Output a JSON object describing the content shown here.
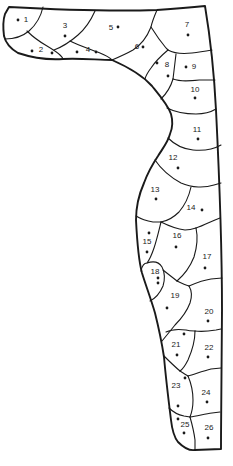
{
  "diagram": {
    "canvas": {
      "width": 233,
      "height": 466,
      "background": "#ffffff",
      "stroke_color": "#1a1a1a",
      "dot_radius": 1.4,
      "label_font_size": 8
    },
    "outline_path": "M 9,7 Q 100,12 157,10 Q 185,8 205,6 C 209,30 214,70 216,110 C 219,170 222,250 222,310 C 222,350 221,400 221,449 L 195,450 C 189,451 183,447 178,442 C 174,437 172,429 171,420 C 169,404 166,380 164,357 C 162,344 159,329 155,313 C 151,299 146,286 142,273 C 139,262 137,240 136,220 C 136,205 140,192 144,183 C 148,172 152,165 158,156 C 163,148 168,142 170,134 C 173,127 173,121 171,114 C 168,105 161,97 152,86 C 143,76 128,67 112,60 C 98,60 80,58 63,59 C 48,60 30,57 18,53 C 11,49 6,44 4,36 C 3,28 3,20 5,14 Z",
    "boundaries": [
      {
        "name": "boundary-1-3",
        "d": "M 43,7 C 41,16 37,24 29,31 C 23,36 15,39 5,39"
      },
      {
        "name": "boundary-2-3",
        "d": "M 27,31 C 33,37 40,42 47,46 C 52,49 57,52 60,55 C 62,57 63,58 63,59"
      },
      {
        "name": "boundary-3-4",
        "d": "M 54,50 C 62,47 70,42 78,35 C 85,29 91,20 95,11"
      },
      {
        "name": "boundary-4-5",
        "d": "M 70,41 C 80,46 90,49 100,53 C 105,55 109,57 112,60"
      },
      {
        "name": "boundary-5-7",
        "d": "M 157,10 C 154,17 152,22 151,27 C 147,37 141,45 133,50 C 126,54 119,57 112,60"
      },
      {
        "name": "boundary-6-7",
        "d": "M 151,27 C 156,35 161,42 166,48 L 168,50"
      },
      {
        "name": "boundary-7-8",
        "d": "M 168,50 C 175,54 183,54 192,53 C 200,52 206,51 212,50"
      },
      {
        "name": "boundary-8-9",
        "d": "M 176,54 C 175,62 174,71 173,79"
      },
      {
        "name": "boundary-6-8",
        "d": "M 168,50 C 162,55 155,62 151,68 C 148,72 146,75 145,79"
      },
      {
        "name": "boundary-8-10",
        "d": "M 173,79 C 171,86 166,94 161,99"
      },
      {
        "name": "boundary-9-10",
        "d": "M 173,79 C 181,82 190,81 200,80 C 206,80 211,80 215,80"
      },
      {
        "name": "boundary-10-11",
        "d": "M 167,108 C 175,112 185,114 196,114 C 204,114 211,112 216,109"
      },
      {
        "name": "boundary-11-12",
        "d": "M 168,138 C 174,144 183,149 193,150 C 203,151 214,149 221,145"
      },
      {
        "name": "boundary-12-13",
        "d": "M 155,160 C 161,169 170,177 181,183 C 192,188 205,188 214,185 L 221,183"
      },
      {
        "name": "boundary-13-14",
        "d": "M 191,187 C 189,196 185,205 179,212 C 173,218 167,221 161,222"
      },
      {
        "name": "boundary-13-15",
        "d": "M 136,216 C 141,219 147,221 153,222 L 161,222"
      },
      {
        "name": "boundary-14-16",
        "d": "M 161,222 C 169,226 177,229 185,230 C 189,230 193,229 196,228"
      },
      {
        "name": "boundary-14-17",
        "d": "M 196,228 C 203,226 210,222 215,220 L 220,218"
      },
      {
        "name": "boundary-16-17",
        "d": "M 196,228 C 198,237 197,247 194,257 C 190,267 184,275 177,281"
      },
      {
        "name": "boundary-15-16",
        "d": "M 161,222 C 159,230 157,239 154,248 C 152,254 150,259 147,263"
      },
      {
        "name": "boundary-18-arc",
        "d": "M 141,271 C 142,266 144,263 147,263 C 153,261 159,262 162,267 C 165,272 165,280 163,286 C 160,293 156,298 150,301"
      },
      {
        "name": "boundary-16-19",
        "d": "M 163,270 C 168,274 172,277 177,281"
      },
      {
        "name": "boundary-17-19",
        "d": "M 177,281 C 181,283 185,285 189,286"
      },
      {
        "name": "boundary-17-20",
        "d": "M 189,286 C 196,283 204,280 211,279 L 222,278"
      },
      {
        "name": "boundary-19-20",
        "d": "M 189,286 C 192,291 192,297 190,303 C 187,311 181,319 175,325 C 171,330 167,335 162,341"
      },
      {
        "name": "boundary-20-21",
        "d": "M 166,332 C 172,329 179,329 186,330 C 189,331 192,331 195,331"
      },
      {
        "name": "boundary-20-22",
        "d": "M 195,331 C 202,332 210,331 216,330 L 221,329"
      },
      {
        "name": "boundary-21-22",
        "d": "M 195,331 C 195,341 192,351 188,360 C 185,366 183,369 180,371"
      },
      {
        "name": "boundary-21-23",
        "d": "M 164,356 C 169,361 174,366 180,371"
      },
      {
        "name": "boundary-22-23",
        "d": "M 180,371 C 183,373 186,375 188,376"
      },
      {
        "name": "boundary-22-24",
        "d": "M 188,376 C 195,374 203,371 211,369 L 221,368"
      },
      {
        "name": "boundary-23-24",
        "d": "M 188,376 C 191,383 193,391 193,400 C 193,406 192,412 190,417"
      },
      {
        "name": "boundary-23-25",
        "d": "M 169,408 C 173,412 179,415 184,416 L 190,417"
      },
      {
        "name": "boundary-24-26",
        "d": "M 190,417 C 197,416 205,414 212,413 L 220,412"
      },
      {
        "name": "boundary-25-26",
        "d": "M 190,417 C 192,424 194,432 195,440 L 195,450"
      }
    ],
    "regions": [
      {
        "number": "1",
        "label_x": 26,
        "label_y": 19,
        "dots": [
          [
            18,
            20
          ]
        ]
      },
      {
        "number": "2",
        "label_x": 41,
        "label_y": 49,
        "dots": [
          [
            32,
            51
          ],
          [
            52,
            53
          ]
        ]
      },
      {
        "number": "3",
        "label_x": 65,
        "label_y": 25,
        "dots": [
          [
            65,
            36
          ]
        ]
      },
      {
        "number": "4",
        "label_x": 88,
        "label_y": 49,
        "dots": [
          [
            77,
            52
          ],
          [
            96,
            52
          ]
        ]
      },
      {
        "number": "5",
        "label_x": 111,
        "label_y": 27,
        "dots": [
          [
            118,
            27
          ]
        ]
      },
      {
        "number": "6",
        "label_x": 137,
        "label_y": 46,
        "dots": [
          [
            143,
            47
          ]
        ]
      },
      {
        "number": "7",
        "label_x": 187,
        "label_y": 24,
        "dots": [
          [
            188,
            35
          ]
        ]
      },
      {
        "number": "8",
        "label_x": 167,
        "label_y": 64,
        "dots": [
          [
            157,
            63
          ],
          [
            168,
            76
          ]
        ]
      },
      {
        "number": "9",
        "label_x": 194,
        "label_y": 66,
        "dots": [
          [
            186,
            67
          ]
        ]
      },
      {
        "number": "10",
        "label_x": 195,
        "label_y": 89,
        "dots": [
          [
            195,
            98
          ]
        ]
      },
      {
        "number": "11",
        "label_x": 197,
        "label_y": 129,
        "dots": [
          [
            198,
            139
          ]
        ]
      },
      {
        "number": "12",
        "label_x": 173,
        "label_y": 157,
        "dots": [
          [
            178,
            168
          ]
        ]
      },
      {
        "number": "13",
        "label_x": 155,
        "label_y": 189,
        "dots": [
          [
            156,
            199
          ]
        ]
      },
      {
        "number": "14",
        "label_x": 191,
        "label_y": 207,
        "dots": [
          [
            202,
            210
          ]
        ]
      },
      {
        "number": "15",
        "label_x": 147,
        "label_y": 241,
        "dots": [
          [
            149,
            233
          ],
          [
            147,
            252
          ]
        ]
      },
      {
        "number": "16",
        "label_x": 177,
        "label_y": 235,
        "dots": [
          [
            176,
            247
          ]
        ]
      },
      {
        "number": "17",
        "label_x": 207,
        "label_y": 256,
        "dots": [
          [
            205,
            268
          ]
        ]
      },
      {
        "number": "18",
        "label_x": 155,
        "label_y": 271,
        "dots": [
          [
            158,
            278
          ],
          [
            158,
            283
          ]
        ]
      },
      {
        "number": "19",
        "label_x": 175,
        "label_y": 295,
        "dots": [
          [
            167,
            308
          ]
        ]
      },
      {
        "number": "20",
        "label_x": 209,
        "label_y": 311,
        "dots": [
          [
            208,
            321
          ]
        ]
      },
      {
        "number": "21",
        "label_x": 176,
        "label_y": 344,
        "dots": [
          [
            184,
            334
          ],
          [
            177,
            355
          ]
        ]
      },
      {
        "number": "22",
        "label_x": 209,
        "label_y": 347,
        "dots": [
          [
            208,
            357
          ]
        ]
      },
      {
        "number": "23",
        "label_x": 176,
        "label_y": 385,
        "dots": [
          [
            185,
            378
          ],
          [
            178,
            406
          ]
        ]
      },
      {
        "number": "24",
        "label_x": 206,
        "label_y": 392,
        "dots": [
          [
            207,
            402
          ]
        ]
      },
      {
        "number": "25",
        "label_x": 185,
        "label_y": 424,
        "dots": [
          [
            178,
            419
          ],
          [
            184,
            433
          ]
        ]
      },
      {
        "number": "26",
        "label_x": 209,
        "label_y": 427,
        "dots": [
          [
            208,
            438
          ]
        ]
      }
    ]
  }
}
